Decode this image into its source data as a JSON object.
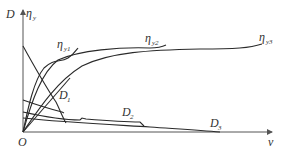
{
  "diagram": {
    "y_axis_label": "D",
    "y_axis_label_2": "η",
    "y_axis_label_2_sub": "y",
    "x_axis_label": "v",
    "origin_label": "O",
    "curves": [
      {
        "id": "eta_y1",
        "label": "η",
        "sub": "y1",
        "kind": "efficiency"
      },
      {
        "id": "eta_y2",
        "label": "η",
        "sub": "y2",
        "kind": "efficiency"
      },
      {
        "id": "eta_y3",
        "label": "η",
        "sub": "y3",
        "kind": "efficiency"
      },
      {
        "id": "D1",
        "label": "D",
        "sub": "1",
        "kind": "D-curve"
      },
      {
        "id": "D2",
        "label": "D",
        "sub": "2",
        "kind": "D-curve"
      },
      {
        "id": "D3",
        "label": "D",
        "sub": "3",
        "kind": "D-curve"
      }
    ],
    "colors": {
      "line": "#2a2a2a",
      "axis": "#555555",
      "text": "#333333"
    }
  }
}
